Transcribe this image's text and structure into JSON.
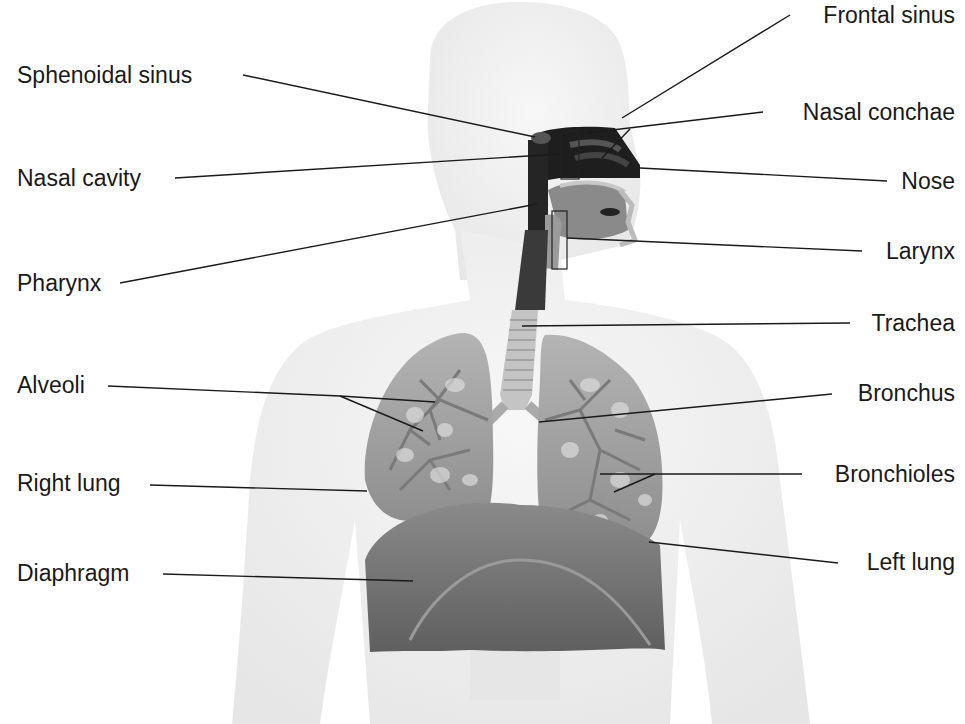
{
  "diagram": {
    "colors": {
      "background": "#ffffff",
      "body": "#f1f1f1",
      "body_edge": "#dcdcdc",
      "cavity_dark": "#1e1e1e",
      "tissue": "#8c8c8c",
      "lung": "#a6a6a6",
      "lung_light": "#d8d8d8",
      "diaphragm": "#7a7a7a",
      "leader_line": "#1a1a1a",
      "text": "#1a1a1a"
    },
    "labels_left": [
      {
        "id": "sphenoidal-sinus",
        "text": "Sphenoidal sinus"
      },
      {
        "id": "nasal-cavity",
        "text": "Nasal cavity"
      },
      {
        "id": "pharynx",
        "text": "Pharynx"
      },
      {
        "id": "alveoli",
        "text": "Alveoli"
      },
      {
        "id": "right-lung",
        "text": "Right lung"
      },
      {
        "id": "diaphragm",
        "text": "Diaphragm"
      }
    ],
    "labels_right": [
      {
        "id": "frontal-sinus",
        "text": "Frontal sinus"
      },
      {
        "id": "nasal-conchae",
        "text": "Nasal conchae"
      },
      {
        "id": "nose",
        "text": "Nose"
      },
      {
        "id": "larynx",
        "text": "Larynx"
      },
      {
        "id": "trachea",
        "text": "Trachea"
      },
      {
        "id": "bronchus",
        "text": "Bronchus"
      },
      {
        "id": "bronchioles",
        "text": "Bronchioles"
      },
      {
        "id": "left-lung",
        "text": "Left lung"
      }
    ]
  }
}
